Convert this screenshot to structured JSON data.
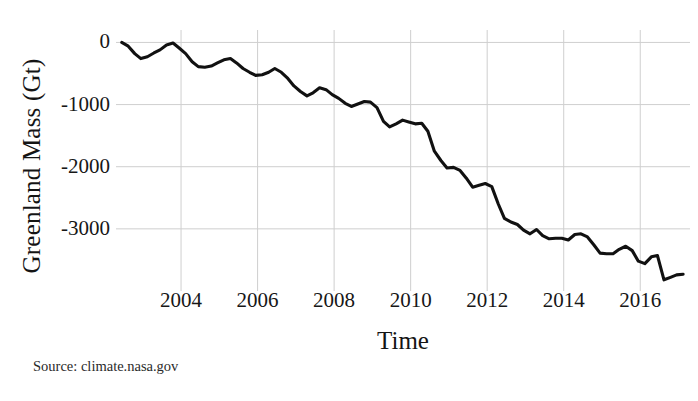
{
  "chart_data": {
    "type": "line",
    "title": "",
    "xlabel": "Time",
    "ylabel": "Greenland Mass (Gt)",
    "xlim": [
      2002.3,
      2017.3
    ],
    "ylim": [
      -4000,
      200
    ],
    "grid": true,
    "legend": null,
    "x_ticks": [
      "2004",
      "2006",
      "2008",
      "2010",
      "2012",
      "2014",
      "2016"
    ],
    "x_tick_values": [
      2004,
      2006,
      2008,
      2010,
      2012,
      2014,
      2016
    ],
    "y_ticks": [
      "0",
      "-1000",
      "-2000",
      "-3000"
    ],
    "y_tick_values": [
      0,
      -1000,
      -2000,
      -3000
    ],
    "series": [
      {
        "name": "Greenland Mass",
        "color": "#111111",
        "units": "Gt",
        "x": [
          2002.45,
          2002.62,
          2002.79,
          2002.95,
          2003.12,
          2003.29,
          2003.45,
          2003.62,
          2003.79,
          2003.95,
          2004.12,
          2004.29,
          2004.45,
          2004.62,
          2004.79,
          2004.95,
          2005.12,
          2005.29,
          2005.45,
          2005.62,
          2005.79,
          2005.95,
          2006.12,
          2006.29,
          2006.45,
          2006.62,
          2006.79,
          2006.95,
          2007.12,
          2007.29,
          2007.45,
          2007.62,
          2007.79,
          2007.95,
          2008.12,
          2008.29,
          2008.45,
          2008.62,
          2008.79,
          2008.95,
          2009.12,
          2009.29,
          2009.45,
          2009.62,
          2009.79,
          2009.95,
          2010.12,
          2010.29,
          2010.45,
          2010.62,
          2010.79,
          2010.95,
          2011.12,
          2011.29,
          2011.45,
          2011.62,
          2011.79,
          2011.95,
          2012.12,
          2012.29,
          2012.45,
          2012.62,
          2012.79,
          2012.95,
          2013.12,
          2013.29,
          2013.45,
          2013.62,
          2013.79,
          2013.95,
          2014.12,
          2014.29,
          2014.45,
          2014.62,
          2014.79,
          2014.95,
          2015.12,
          2015.29,
          2015.45,
          2015.62,
          2015.79,
          2015.95,
          2016.12,
          2016.29,
          2016.45,
          2016.62,
          2016.79,
          2016.95,
          2017.12
        ],
        "y": [
          0,
          -60,
          -180,
          -260,
          -230,
          -170,
          -120,
          -40,
          -10,
          -90,
          -180,
          -310,
          -390,
          -400,
          -380,
          -330,
          -280,
          -260,
          -330,
          -420,
          -480,
          -530,
          -520,
          -480,
          -420,
          -480,
          -580,
          -700,
          -790,
          -860,
          -810,
          -730,
          -760,
          -840,
          -900,
          -980,
          -1030,
          -990,
          -950,
          -960,
          -1050,
          -1270,
          -1360,
          -1310,
          -1250,
          -1280,
          -1310,
          -1300,
          -1430,
          -1750,
          -1900,
          -2020,
          -2010,
          -2060,
          -2180,
          -2330,
          -2300,
          -2270,
          -2320,
          -2600,
          -2830,
          -2890,
          -2930,
          -3020,
          -3080,
          -3010,
          -3110,
          -3160,
          -3150,
          -3150,
          -3180,
          -3090,
          -3080,
          -3130,
          -3260,
          -3390,
          -3400,
          -3400,
          -3330,
          -3280,
          -3350,
          -3520,
          -3560,
          -3450,
          -3430,
          -3820,
          -3780,
          -3740,
          -3730
        ]
      }
    ],
    "source_note": "Source: climate.nasa.gov"
  },
  "axes": {
    "y_title": "Greenland Mass (Gt)",
    "x_title": "Time"
  },
  "footer": {
    "source": "Source: climate.nasa.gov"
  }
}
